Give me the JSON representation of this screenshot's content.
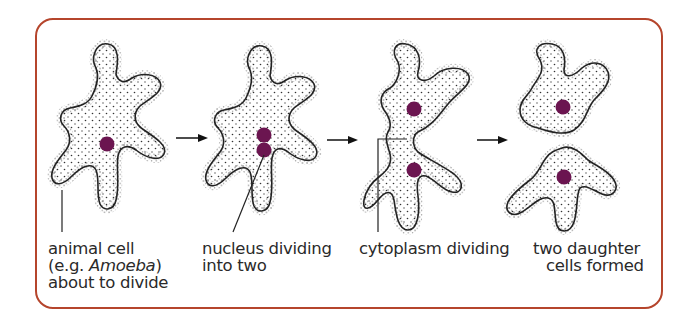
{
  "figure": {
    "type": "diagram",
    "border_color": "#b5452c",
    "nucleus_color": "#6b1550",
    "stages": [
      {
        "id": "stage-1",
        "lines": [
          "animal cell",
          "(e.g. ",
          "Amoeba",
          ")",
          "about to divide"
        ],
        "line1": "animal cell",
        "line2_prefix": "(e.g. ",
        "line2_italic": "Amoeba",
        "line2_suffix": ")",
        "line3": "about to divide"
      },
      {
        "id": "stage-2",
        "line1": "nucleus dividing",
        "line2": "into two"
      },
      {
        "id": "stage-3",
        "line1": "cytoplasm dividing"
      },
      {
        "id": "stage-4",
        "line1": "two daughter",
        "line2": "cells formed"
      }
    ],
    "arrows": [
      "arrow-1-to-2",
      "arrow-2-to-3",
      "arrow-3-to-4"
    ]
  }
}
